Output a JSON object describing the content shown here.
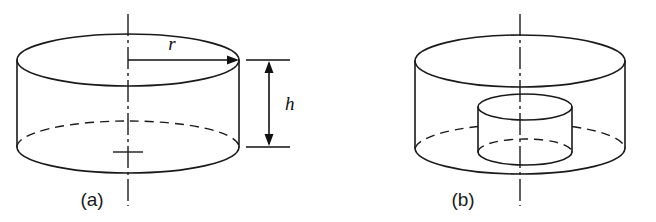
{
  "figure": {
    "background_color": "#ffffff",
    "line_color": "#1a1a1a",
    "panels": [
      {
        "caption": "(a)",
        "description": "solid circular cylinder with radius and height dimensioned",
        "dimensions": [
          {
            "symbol": "r",
            "meaning": "radius",
            "style": "single-arrow-from-axis"
          },
          {
            "symbol": "h",
            "meaning": "height",
            "style": "double-arrow-vertical"
          }
        ]
      },
      {
        "caption": "(b)",
        "description": "circular cylinder containing a smaller coaxial inner cylinder",
        "dimensions": []
      }
    ]
  },
  "labels": {
    "radius": "r",
    "height": "h",
    "caption_a": "(a)",
    "caption_b": "(b)"
  }
}
